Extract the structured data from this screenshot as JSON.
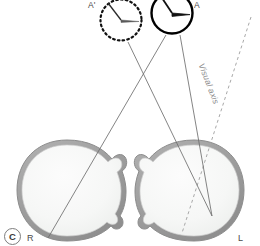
{
  "figure": {
    "panel_letter": "C",
    "background_color": "#ffffff",
    "width": 260,
    "height": 246
  },
  "labels": {
    "stimulus_perceived": "A'",
    "stimulus_real": "A",
    "right_eye": "R",
    "left_eye": "L",
    "visual_axis": "Visual axis"
  },
  "colors": {
    "sclera_outline": "#9b9b9b",
    "sclera_fill": "#f2f3f2",
    "interior_fill": "#f7f8f7",
    "ray_line": "#6e6e6e",
    "visual_axis_line": "#a8a8a8",
    "clock_solid": "#000000",
    "clock_dashed": "#111111",
    "label_text": "#4a4a4a",
    "axis_text": "#8a8a8a"
  },
  "objects": {
    "clock_real": {
      "name": "A",
      "style": "solid",
      "center_x": 172,
      "center_y": 13,
      "radius": 21,
      "hour_hand_angle_deg": -58,
      "minute_hand_angle_deg": 8
    },
    "clock_perceived": {
      "name": "A'",
      "style": "dashed",
      "center_x": 121,
      "center_y": 20,
      "radius": 21,
      "hour_hand_angle_deg": -62,
      "minute_hand_angle_deg": 6
    },
    "eye_right": {
      "name": "R",
      "center_x": 67,
      "center_y": 190,
      "radius": 50
    },
    "eye_left": {
      "name": "L",
      "center_x": 194,
      "center_y": 190,
      "radius": 50
    }
  },
  "rays": [
    {
      "name": "ray-A-to-right-eye",
      "x1": 166,
      "y1": 35,
      "x2": 48,
      "y2": 238
    },
    {
      "name": "ray-A-to-left-eye",
      "x1": 180,
      "y1": 35,
      "x2": 212,
      "y2": 216
    },
    {
      "name": "ray-Aprime-to-left-eye",
      "x1": 128,
      "y1": 42,
      "x2": 212,
      "y2": 216
    }
  ],
  "visual_axis_line": {
    "name": "visual-axis",
    "x1": 251,
    "y1": 17,
    "x2": 182,
    "y2": 233,
    "dash": "3,3"
  }
}
